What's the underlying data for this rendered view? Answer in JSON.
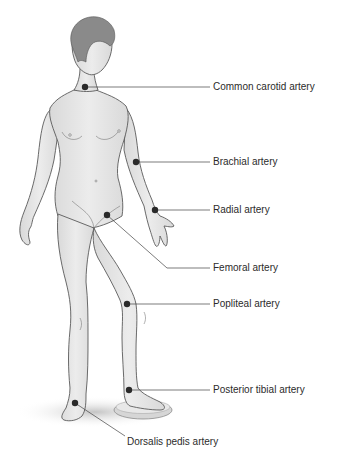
{
  "diagram": {
    "type": "anatomical-pulse-points",
    "colors": {
      "skin": "#e4e4e4",
      "outline": "#5a5a5a",
      "hair": "#8a8a8a",
      "dot": "#2a2a2a",
      "leader_line": "#444444",
      "shadow": "#cfcfcf"
    },
    "labels": [
      {
        "id": "common-carotid",
        "text": "Common carotid artery",
        "dot": [
          85,
          87
        ],
        "elbow": null,
        "line_end": [
          210,
          87
        ],
        "label_pos": [
          213,
          81
        ]
      },
      {
        "id": "brachial",
        "text": "Brachial artery",
        "dot": [
          136,
          162
        ],
        "elbow": null,
        "line_end": [
          210,
          162
        ],
        "label_pos": [
          213,
          156
        ]
      },
      {
        "id": "radial",
        "text": "Radial artery",
        "dot": [
          155,
          210
        ],
        "elbow": null,
        "line_end": [
          210,
          210
        ],
        "label_pos": [
          213,
          204
        ]
      },
      {
        "id": "femoral",
        "text": "Femoral artery",
        "dot": [
          107,
          215
        ],
        "elbow": [
          167,
          268
        ],
        "line_end": [
          210,
          268
        ],
        "label_pos": [
          213,
          262
        ]
      },
      {
        "id": "popliteal",
        "text": "Popliteal artery",
        "dot": [
          127,
          304
        ],
        "elbow": null,
        "line_end": [
          210,
          304
        ],
        "label_pos": [
          213,
          298
        ]
      },
      {
        "id": "posterior-tibial",
        "text": "Posterior tibial artery",
        "dot": [
          129,
          390
        ],
        "elbow": null,
        "line_end": [
          210,
          390
        ],
        "label_pos": [
          213,
          384
        ]
      },
      {
        "id": "dorsalis-pedis",
        "text": "Dorsalis pedis artery",
        "dot": [
          75,
          403
        ],
        "elbow": null,
        "line_end": [
          125,
          436
        ],
        "label_pos": [
          127,
          436
        ]
      }
    ]
  }
}
